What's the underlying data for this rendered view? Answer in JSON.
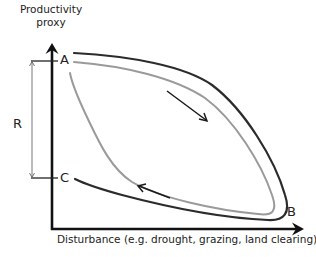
{
  "diagram": {
    "y_axis_label_line1": "Productivity",
    "y_axis_label_line2": "proxy",
    "x_axis_label": "Disturbance (e.g. drought, grazing, land clearing)",
    "points": {
      "a": "A",
      "b": "B",
      "c": "C"
    },
    "bracket_label": "R",
    "colors": {
      "axis": "#111111",
      "outer_curve": "#2b2b2b",
      "inner_curve": "#9a9a9a",
      "arrow": "#1a1a1a",
      "bracket": "#555555",
      "text": "#222222"
    }
  }
}
